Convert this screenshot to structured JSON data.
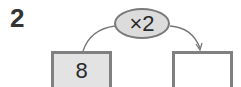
{
  "problem": {
    "number": "2"
  },
  "operation": {
    "label": "×2",
    "fill_color": "#dcdcdc",
    "border_color": "#7a7a7a"
  },
  "input_box": {
    "value": "8",
    "fill_color": "#e3e3e3"
  },
  "output_box": {
    "value": "",
    "fill_color": "#ffffff"
  }
}
